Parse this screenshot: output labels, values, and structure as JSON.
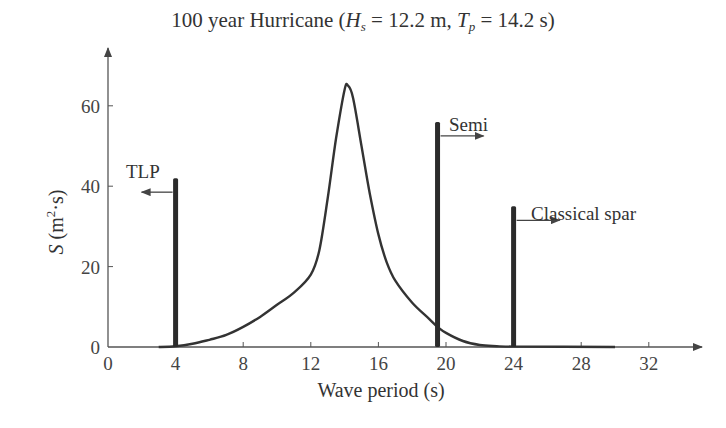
{
  "title": {
    "prefix": "100 year Hurricane (",
    "hs_symbol": "H",
    "hs_sub": "s",
    "hs_value": " = 12.2 m, ",
    "tp_symbol": "T",
    "tp_sub": "p",
    "tp_value": " = 14.2 s)"
  },
  "axes": {
    "xlabel": "Wave period (s)",
    "ylabel_symbol": "S",
    "ylabel_unit_open": " (m",
    "ylabel_sup": "2",
    "ylabel_unit_close": "·s)",
    "xticks": [
      "0",
      "4",
      "8",
      "12",
      "16",
      "20",
      "24",
      "28",
      "32"
    ],
    "yticks": [
      "0",
      "20",
      "40",
      "60"
    ]
  },
  "annotations": {
    "tlp": "TLP",
    "semi": "Semi",
    "spar": "Classical spar"
  },
  "colors": {
    "line": "#333333",
    "axis": "#555555",
    "bar": "#2b2b2b"
  },
  "chart_data": {
    "type": "line",
    "title": "100 year Hurricane (Hs = 12.2 m, Tp = 14.2 s)",
    "xlabel": "Wave period (s)",
    "ylabel": "S (m²·s)",
    "xlim": [
      0,
      35
    ],
    "ylim": [
      0,
      72
    ],
    "xticks": [
      0,
      4,
      8,
      12,
      16,
      20,
      24,
      28,
      32
    ],
    "yticks": [
      0,
      20,
      40,
      60
    ],
    "grid": false,
    "legend": null,
    "series": [
      {
        "name": "Wave spectrum S(T)",
        "x": [
          3,
          4,
          5,
          6,
          7,
          8,
          9,
          10,
          11,
          12,
          12.5,
          13,
          13.5,
          14,
          14.2,
          14.5,
          15,
          15.5,
          16,
          16.5,
          17,
          18,
          19,
          19.5,
          20,
          21,
          22,
          23,
          24,
          30
        ],
        "y": [
          0,
          0.2,
          0.8,
          1.8,
          3,
          5,
          7.5,
          10.5,
          13.5,
          18,
          24,
          37,
          52,
          64,
          65,
          62,
          50,
          38,
          28,
          21,
          16.5,
          11,
          7,
          5,
          3.5,
          1.5,
          0.5,
          0.2,
          0.1,
          0
        ]
      }
    ],
    "vertical_bars": [
      {
        "name": "TLP",
        "x": 4,
        "height": 42,
        "arrow": "left"
      },
      {
        "name": "Semi",
        "x": 19.5,
        "height": 56,
        "arrow": "right"
      },
      {
        "name": "Classical spar",
        "x": 24,
        "height": 35,
        "arrow": "right"
      }
    ],
    "peak": {
      "x": 14.2,
      "y": 65
    }
  }
}
